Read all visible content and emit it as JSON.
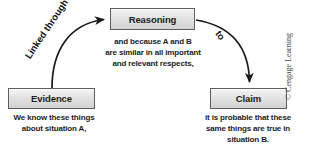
{
  "diagram": {
    "nodes": [
      {
        "id": "evidence",
        "label": "Evidence",
        "caption_lines": [
          "We know these things",
          "about situation A,"
        ]
      },
      {
        "id": "reasoning",
        "label": "Reasoning",
        "caption_lines": [
          "and because A and B",
          "are similar in all important",
          "and relevant respects,"
        ]
      },
      {
        "id": "claim",
        "label": "Claim",
        "caption_lines": [
          "it is probable that these",
          "same things are true in",
          "situation B."
        ]
      }
    ],
    "edges": [
      {
        "id": "evidence-to-reasoning",
        "label": "Linked through",
        "from": "evidence",
        "to": "reasoning"
      },
      {
        "id": "reasoning-to-claim",
        "label": "to",
        "from": "reasoning",
        "to": "claim"
      }
    ],
    "credit": "© Cengage Learning",
    "colors": {
      "box_border": "#5e5e5e",
      "box_fill_top": "#f4f4f4",
      "box_fill_bottom": "#d2d2d2",
      "text": "#1b1b1b",
      "arrow": "#1a1a1a",
      "credit_text": "#4a4a4a",
      "background": "#ffffff"
    }
  }
}
